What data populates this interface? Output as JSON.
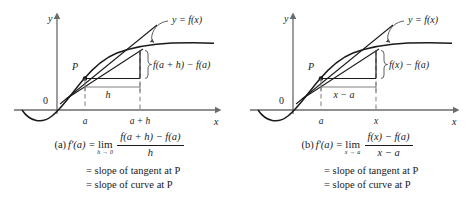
{
  "figure": {
    "colors": {
      "axis": "#6b6b6b",
      "curve": "#1a1a1a",
      "tangent": "#1a1a1a",
      "secant": "#1a1a1a",
      "dashed": "#7a7a7a",
      "text": "#1a1a1a",
      "background": "#ffffff"
    }
  },
  "panels": [
    {
      "id": "a",
      "graph": {
        "y_axis_label": "y",
        "x_axis_label": "x",
        "origin_label": "0",
        "curve_label": "y = f(x)",
        "point_label": "P",
        "tick_labels": [
          "a",
          "a + h"
        ],
        "run_label": "h",
        "rise_label": "f(a + h) − f(a)"
      },
      "caption": {
        "tag": "(a)",
        "lhs": "f′(a) =",
        "limit_op": "lim",
        "limit_sub": "h → 0",
        "numerator": "f(a + h) − f(a)",
        "denominator": "h",
        "line2": "= slope of tangent at P",
        "line3": "= slope of curve at P"
      }
    },
    {
      "id": "b",
      "graph": {
        "y_axis_label": "y",
        "x_axis_label": "x",
        "origin_label": "0",
        "curve_label": "y = f(x)",
        "point_label": "P",
        "tick_labels": [
          "a",
          "x"
        ],
        "run_label": "x − a",
        "rise_label": "f(x) − f(a)"
      },
      "caption": {
        "tag": "(b)",
        "lhs": "f′(a) =",
        "limit_op": "lim",
        "limit_sub": "x → a",
        "numerator": "f(x) − f(a)",
        "denominator": "x − a",
        "line2": "= slope of tangent at P",
        "line3": "= slope of curve at P"
      }
    }
  ]
}
